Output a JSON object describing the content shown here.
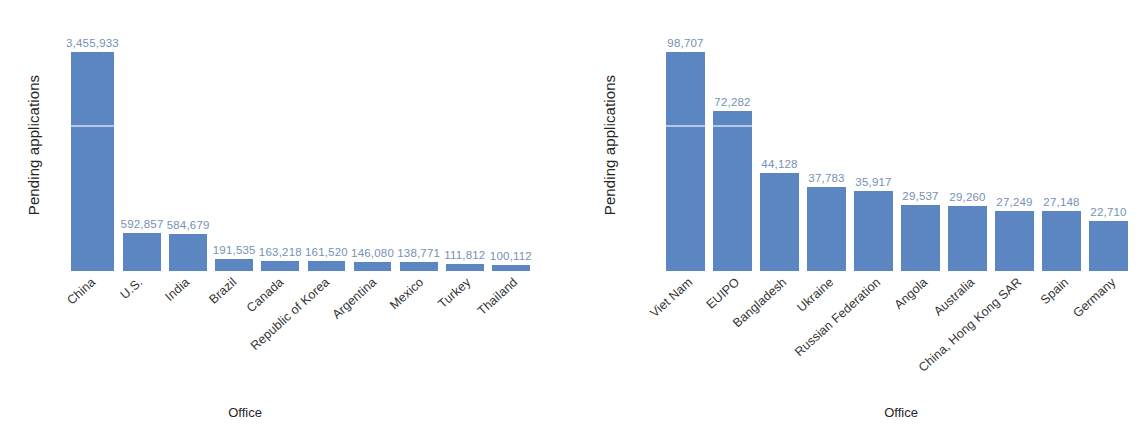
{
  "figure": {
    "background": "#ffffff",
    "bar_color": "#5b86c2",
    "data_label_color": "#7691b5",
    "category_label_color": "#333333"
  },
  "chart_data": [
    {
      "type": "bar",
      "title": "",
      "xlabel": "Office",
      "ylabel": "Pending applications",
      "categories": [
        "China",
        "U.S.",
        "India",
        "Brazil",
        "Canada",
        "Republic of Korea",
        "Argentina",
        "Mexico",
        "Turkey",
        "Thailand"
      ],
      "values": [
        3455933,
        592857,
        584679,
        191535,
        163218,
        161520,
        146080,
        138771,
        111812,
        100112
      ],
      "value_labels": [
        "3,455,933",
        "592,857",
        "584,679",
        "191,535",
        "163,218",
        "161,520",
        "146,080",
        "138,771",
        "111,812",
        "100,112"
      ],
      "ylim": [
        0,
        3455933
      ],
      "grid": false,
      "legend": false,
      "bar_color": "#5b86c2"
    },
    {
      "type": "bar",
      "title": "",
      "xlabel": "Office",
      "ylabel": "Pending applications",
      "categories": [
        "Viet Nam",
        "EUIPO",
        "Bangladesh",
        "Ukraine",
        "Russian Federation",
        "Angola",
        "Australia",
        "China, Hong Kong SAR",
        "Spain",
        "Germany"
      ],
      "values": [
        98707,
        72282,
        44128,
        37783,
        35917,
        29537,
        29260,
        27249,
        27148,
        22710
      ],
      "value_labels": [
        "98,707",
        "72,282",
        "44,128",
        "37,783",
        "35,917",
        "29,537",
        "29,260",
        "27,249",
        "27,148",
        "22,710"
      ],
      "ylim": [
        0,
        98707
      ],
      "grid": false,
      "legend": false,
      "bar_color": "#5b86c2"
    }
  ]
}
